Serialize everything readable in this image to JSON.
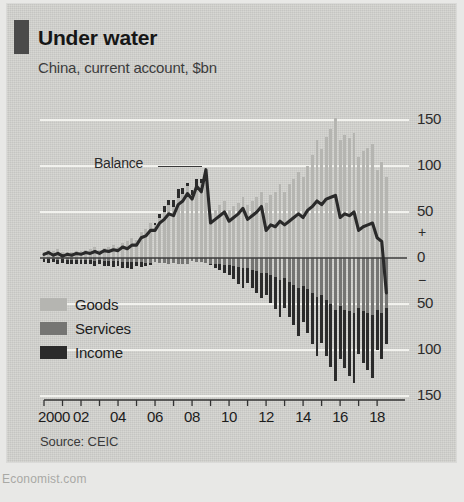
{
  "card": {
    "marker_color": "#4a4a4a",
    "background": "#d3d3cf"
  },
  "header": {
    "title": "Under water",
    "subtitle": "China, current account, $bn"
  },
  "annotation": {
    "balance_label": "Balance"
  },
  "legend": {
    "items": [
      {
        "label": "Goods",
        "color": "#b5b5b1"
      },
      {
        "label": "Services",
        "color": "#757573"
      },
      {
        "label": "Income",
        "color": "#2b2b2b"
      }
    ]
  },
  "source": {
    "text": "Source: CEIC"
  },
  "footer": {
    "text": "Economist.com"
  },
  "chart_data": {
    "type": "bar",
    "title": "Under water",
    "subtitle": "China, current account, $bn",
    "xlabel": "",
    "ylabel": "$bn",
    "ylim": [
      -150,
      150
    ],
    "yticks": [
      150,
      100,
      50,
      0,
      -50,
      -100,
      -150
    ],
    "ytick_labels": [
      "150",
      "100",
      "50",
      "0",
      "50",
      "100",
      "150"
    ],
    "sign_labels": {
      "positive": "+",
      "negative": "−"
    },
    "grid": true,
    "grid_color": "#f2f2ee",
    "zero_line_color": "#3c3c3c",
    "legend_position": "lower-left",
    "xlim": [
      2000,
      2018.75
    ],
    "xticks": [
      2000,
      2001,
      2002,
      2003,
      2004,
      2005,
      2006,
      2007,
      2008,
      2009,
      2010,
      2011,
      2012,
      2013,
      2014,
      2015,
      2016,
      2017,
      2018
    ],
    "xtick_labels": [
      "2000",
      "",
      "02",
      "",
      "04",
      "",
      "06",
      "",
      "08",
      "",
      "10",
      "",
      "12",
      "",
      "14",
      "",
      "16",
      "",
      "18"
    ],
    "x_quarters": [
      2000.0,
      2000.25,
      2000.5,
      2000.75,
      2001.0,
      2001.25,
      2001.5,
      2001.75,
      2002.0,
      2002.25,
      2002.5,
      2002.75,
      2003.0,
      2003.25,
      2003.5,
      2003.75,
      2004.0,
      2004.25,
      2004.5,
      2004.75,
      2005.0,
      2005.25,
      2005.5,
      2005.75,
      2006.0,
      2006.25,
      2006.5,
      2006.75,
      2007.0,
      2007.25,
      2007.5,
      2007.75,
      2008.0,
      2008.25,
      2008.5,
      2008.75,
      2009.0,
      2009.25,
      2009.5,
      2009.75,
      2010.0,
      2010.25,
      2010.5,
      2010.75,
      2011.0,
      2011.25,
      2011.5,
      2011.75,
      2012.0,
      2012.25,
      2012.5,
      2012.75,
      2013.0,
      2013.25,
      2013.5,
      2013.75,
      2014.0,
      2014.25,
      2014.5,
      2014.75,
      2015.0,
      2015.25,
      2015.5,
      2015.75,
      2016.0,
      2016.25,
      2016.5,
      2016.75,
      2017.0,
      2017.25,
      2017.5,
      2017.75,
      2018.0,
      2018.25,
      2018.5
    ],
    "series": [
      {
        "name": "Goods",
        "color": "#b5b5b1",
        "values": [
          7,
          9,
          8,
          10,
          6,
          7,
          6,
          8,
          8,
          9,
          10,
          12,
          9,
          11,
          12,
          14,
          12,
          16,
          18,
          22,
          20,
          28,
          32,
          38,
          36,
          44,
          50,
          58,
          55,
          65,
          70,
          78,
          68,
          78,
          82,
          86,
          48,
          52,
          58,
          62,
          52,
          56,
          60,
          66,
          58,
          62,
          66,
          72,
          60,
          68,
          72,
          80,
          72,
          80,
          86,
          94,
          88,
          100,
          112,
          128,
          118,
          132,
          140,
          152,
          128,
          134,
          130,
          136,
          110,
          116,
          120,
          124,
          96,
          104,
          88
        ]
      },
      {
        "name": "Services",
        "color": "#757573",
        "values": [
          -1,
          -1,
          -1,
          -2,
          -1,
          -2,
          -2,
          -2,
          -2,
          -2,
          -2,
          -3,
          -2,
          -3,
          -3,
          -3,
          -3,
          -4,
          -4,
          -4,
          -4,
          -4,
          -5,
          -5,
          -4,
          -5,
          -5,
          -6,
          -5,
          -6,
          -6,
          -7,
          -3,
          -4,
          -4,
          -5,
          -6,
          -7,
          -7,
          -8,
          -8,
          -9,
          -10,
          -11,
          -11,
          -13,
          -14,
          -16,
          -16,
          -19,
          -21,
          -24,
          -22,
          -26,
          -29,
          -33,
          -30,
          -34,
          -38,
          -42,
          -40,
          -46,
          -50,
          -56,
          -52,
          -56,
          -58,
          -60,
          -54,
          -58,
          -60,
          -62,
          -56,
          -60,
          -54
        ]
      },
      {
        "name": "Income",
        "color": "#2b2b2b",
        "values": [
          -3,
          -4,
          -3,
          -4,
          -4,
          -5,
          -4,
          -5,
          -4,
          -5,
          -5,
          -6,
          -5,
          -6,
          -6,
          -7,
          -6,
          -7,
          -7,
          -8,
          -5,
          -6,
          -4,
          -3,
          2,
          4,
          6,
          5,
          8,
          10,
          6,
          4,
          6,
          8,
          4,
          2,
          -2,
          -4,
          -6,
          -8,
          -10,
          -14,
          -18,
          -22,
          -16,
          -20,
          -24,
          -28,
          -24,
          -30,
          -34,
          -40,
          -32,
          -38,
          -44,
          -52,
          -40,
          -48,
          -56,
          -64,
          -52,
          -60,
          -68,
          -78,
          -58,
          -64,
          -70,
          -76,
          -50,
          -56,
          -62,
          -68,
          -44,
          -50,
          -40
        ]
      }
    ],
    "line_series": {
      "name": "Balance",
      "color": "#2a2a2a",
      "values": [
        4,
        6,
        3,
        5,
        2,
        4,
        3,
        5,
        4,
        6,
        5,
        7,
        5,
        8,
        7,
        9,
        8,
        12,
        10,
        14,
        14,
        22,
        24,
        30,
        30,
        38,
        42,
        48,
        46,
        58,
        62,
        70,
        64,
        78,
        72,
        96,
        38,
        42,
        46,
        50,
        40,
        44,
        48,
        54,
        42,
        46,
        50,
        56,
        30,
        36,
        34,
        40,
        36,
        40,
        44,
        48,
        44,
        52,
        56,
        62,
        58,
        64,
        66,
        68,
        44,
        48,
        46,
        50,
        30,
        34,
        36,
        38,
        22,
        18,
        -38
      ]
    }
  }
}
